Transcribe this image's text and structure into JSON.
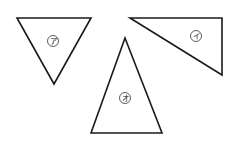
{
  "diagram": {
    "background": "#ffffff",
    "stroke_color": "#1a1a1a",
    "shapes": [
      {
        "id": "a",
        "type": "triangle",
        "description": "inverted (point-down) triangle",
        "points": [
          [
            17,
            18
          ],
          [
            91,
            18
          ],
          [
            54,
            84
          ]
        ],
        "label": "ア",
        "label_pos": [
          53,
          41
        ]
      },
      {
        "id": "i",
        "type": "triangle",
        "description": "right triangle with right angle at top-right",
        "points": [
          [
            130,
            18
          ],
          [
            222,
            18
          ],
          [
            222,
            75
          ]
        ],
        "label": "イ",
        "label_pos": [
          196,
          36
        ]
      },
      {
        "id": "o",
        "type": "triangle",
        "description": "tall isosceles triangle, point-up",
        "points": [
          [
            125,
            38
          ],
          [
            91,
            133
          ],
          [
            162,
            133
          ]
        ],
        "label": "オ",
        "label_pos": [
          125,
          98
        ]
      }
    ],
    "label_circle_radius": 5.5
  }
}
